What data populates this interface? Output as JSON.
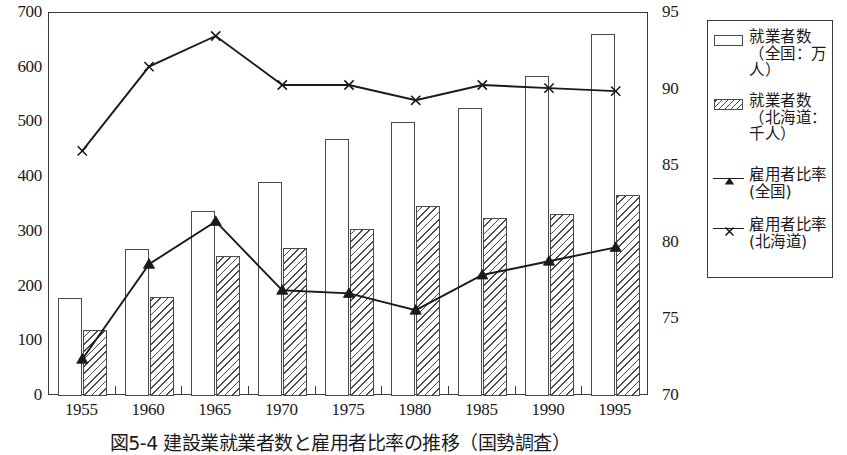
{
  "chart_data": {
    "type": "bar",
    "title": "図5-4 建設業就業者数と雇用者比率の推移（国勢調査）",
    "categories": [
      "1955",
      "1960",
      "1965",
      "1970",
      "1975",
      "1980",
      "1985",
      "1990",
      "1995"
    ],
    "xlabel": "",
    "ylabel": "",
    "ylim": [
      0,
      700
    ],
    "y2lim": [
      70,
      95
    ],
    "yticks": [
      "0",
      "100",
      "200",
      "300",
      "400",
      "500",
      "600",
      "700"
    ],
    "y2ticks": [
      "70",
      "75",
      "80",
      "85",
      "90",
      "95"
    ],
    "grid": false,
    "legend_position": "right-outside",
    "series": [
      {
        "name": "就業者数（全国：万人）",
        "type": "bar",
        "style": "plain",
        "axis": "left",
        "values": [
          180,
          268,
          338,
          392,
          470,
          501,
          527,
          585,
          662
        ]
      },
      {
        "name": "就業者数（北海道：千人）",
        "type": "bar",
        "style": "hatched",
        "axis": "left",
        "values": [
          121,
          181,
          255,
          271,
          305,
          348,
          325,
          333,
          368
        ]
      },
      {
        "name": "雇用者比率（全国）",
        "type": "line",
        "marker": "filled-triangle",
        "axis": "right",
        "values": [
          72.4,
          78.6,
          81.4,
          76.9,
          76.7,
          75.6,
          77.9,
          78.8,
          79.7
        ]
      },
      {
        "name": "雇用者比率（北海道）",
        "type": "line",
        "marker": "cross-x",
        "axis": "right",
        "values": [
          86.0,
          91.5,
          93.5,
          90.3,
          90.3,
          89.3,
          90.3,
          90.1,
          89.9
        ]
      }
    ]
  },
  "axes": {
    "left_ticks": [
      "700",
      "600",
      "500",
      "400",
      "300",
      "200",
      "100",
      "0"
    ],
    "right_ticks": [
      "95",
      "90",
      "85",
      "80",
      "75",
      "70"
    ],
    "x_ticks": [
      "1955",
      "1960",
      "1965",
      "1970",
      "1975",
      "1980",
      "1985",
      "1990",
      "1995"
    ]
  },
  "legend": {
    "entries": [
      {
        "key": "plain-bar-swatch",
        "label": "就業者数（全国：万人）"
      },
      {
        "key": "hatched-bar-swatch",
        "label": "就業者数（北海道：千人）"
      },
      {
        "key": "triangle-line-marker",
        "label": "雇用者比率(全国)"
      },
      {
        "key": "cross-line-marker",
        "label": "雇用者比率 (北海道)"
      }
    ]
  },
  "caption": {
    "text": "図5-4 建設業就業者数と雇用者比率の推移（国勢調査）"
  }
}
